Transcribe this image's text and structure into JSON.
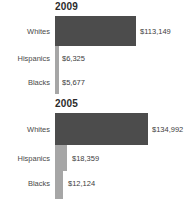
{
  "chart_data": [
    {
      "type": "bar",
      "orientation": "horizontal",
      "title": "2009",
      "xlabel": "",
      "ylabel": "",
      "grid": false,
      "legend": "none",
      "categories": [
        "Whites",
        "Hispanics",
        "Blacks"
      ],
      "values": [
        113149,
        6325,
        5677
      ],
      "value_labels": [
        "$113,149",
        "$6,325",
        "$5,677"
      ],
      "xlim": [
        0,
        134992
      ],
      "bar_color": "#4c4c4c",
      "small_bar_color": "#a6a6a6"
    },
    {
      "type": "bar",
      "orientation": "horizontal",
      "title": "2005",
      "xlabel": "",
      "ylabel": "",
      "grid": false,
      "legend": "none",
      "categories": [
        "Whites",
        "Hispanics",
        "Blacks"
      ],
      "values": [
        134992,
        18359,
        12124
      ],
      "value_labels": [
        "$134,992",
        "$18,359",
        "$12,124"
      ],
      "xlim": [
        0,
        134992
      ],
      "bar_color": "#4c4c4c",
      "small_bar_color": "#a6a6a6"
    }
  ],
  "panels": [
    {
      "title": "2009",
      "rows": [
        {
          "category": "Whites",
          "value_label": "$113,149"
        },
        {
          "category": "Hispanics",
          "value_label": "$6,325"
        },
        {
          "category": "Blacks",
          "value_label": "$5,677"
        }
      ]
    },
    {
      "title": "2005",
      "rows": [
        {
          "category": "Whites",
          "value_label": "$134,992"
        },
        {
          "category": "Hispanics",
          "value_label": "$18,359"
        },
        {
          "category": "Blacks",
          "value_label": "$12,124"
        }
      ]
    }
  ]
}
